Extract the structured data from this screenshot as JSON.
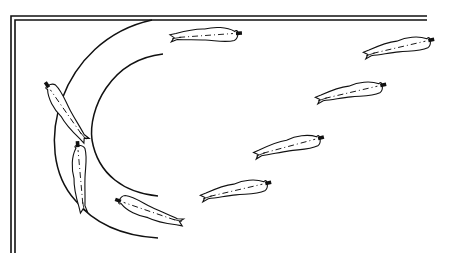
{
  "diagram": {
    "colors": {
      "stroke": "#111111",
      "background": "#ffffff"
    },
    "frame": {
      "outer": {
        "top_y": 16,
        "left_x": 11,
        "right_x": 427,
        "bottom_y": 253
      },
      "inner": {
        "top_y": 20,
        "left_x": 15,
        "right_x": 427,
        "bottom_y": 253
      }
    },
    "arcs": [
      {
        "name": "outer-arc",
        "d": "M 152 20 C 60 40, 30 150, 75 200 C 95 225, 125 236, 158 238"
      },
      {
        "name": "inner-arc",
        "d": "M 163 54 C 110 60, 88 110, 92 140 C 98 175, 125 193, 158 196"
      }
    ],
    "figures": [
      {
        "id": 1,
        "cx": 205,
        "cy": 35,
        "angle": -3
      },
      {
        "id": 2,
        "cx": 398,
        "cy": 47,
        "angle": -12
      },
      {
        "id": 3,
        "cx": 350,
        "cy": 92,
        "angle": -12
      },
      {
        "id": 4,
        "cx": 288,
        "cy": 146,
        "angle": -14
      },
      {
        "id": 5,
        "cx": 235,
        "cy": 190,
        "angle": -12
      },
      {
        "id": 6,
        "cx": 150,
        "cy": 212,
        "angle": 200
      },
      {
        "id": 7,
        "cx": 80,
        "cy": 178,
        "angle": 266
      },
      {
        "id": 8,
        "cx": 66,
        "cy": 113,
        "angle": 236
      }
    ]
  }
}
